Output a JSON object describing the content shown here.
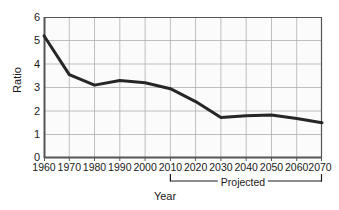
{
  "chart_data": {
    "type": "line",
    "title": "",
    "xlabel": "Year",
    "ylabel": "Ratio",
    "x": [
      1960,
      1970,
      1980,
      1990,
      2000,
      2010,
      2020,
      2030,
      2040,
      2050,
      2060,
      2070
    ],
    "values": [
      5.2,
      3.55,
      3.1,
      3.3,
      3.2,
      2.95,
      2.4,
      1.72,
      1.8,
      1.83,
      1.68,
      1.5
    ],
    "series": [
      {
        "name": "Ratio",
        "values": [
          5.2,
          3.55,
          3.1,
          3.3,
          3.2,
          2.95,
          2.4,
          1.72,
          1.8,
          1.83,
          1.68,
          1.5
        ]
      }
    ],
    "xlim": [
      1960,
      2070
    ],
    "ylim": [
      0,
      6
    ],
    "y_ticks": [
      0,
      1,
      2,
      3,
      4,
      5,
      6
    ],
    "x_ticks": [
      1960,
      1970,
      1980,
      1990,
      2000,
      2010,
      2020,
      2030,
      2040,
      2050,
      2060,
      2070
    ],
    "grid": true,
    "legend": "none",
    "line_color": "#262626",
    "grid_color": "#b3b3b3",
    "axis_color": "#4d4d4d",
    "plot_background": "#fbfbfb",
    "annotations": [
      {
        "name": "projected-bracket",
        "label": "Projected",
        "from_x": 2010,
        "to_x": 2070
      }
    ]
  },
  "axes": {
    "y_title": "Ratio",
    "x_title": "Year",
    "y_tick_labels": [
      "6",
      "5",
      "4",
      "3",
      "2",
      "1",
      "0"
    ],
    "x_tick_labels": [
      "1960",
      "1970",
      "1980",
      "1990",
      "2000",
      "2010",
      "2020",
      "2030",
      "2040",
      "2050",
      "2060",
      "2070"
    ]
  },
  "annotation": {
    "projected_label": "Projected"
  }
}
